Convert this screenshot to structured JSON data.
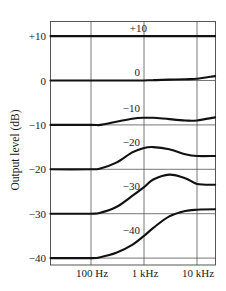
{
  "chart_data": {
    "type": "line",
    "title": "",
    "xlabel": "",
    "ylabel": "Output level (dB)",
    "x_scale": "log",
    "x_ticks": [
      {
        "value": 100,
        "label": "100 Hz"
      },
      {
        "value": 1000,
        "label": "1 kHz"
      },
      {
        "value": 10000,
        "label": "10 kHz"
      }
    ],
    "y_ticks": [
      {
        "value": 10,
        "label": "+10"
      },
      {
        "value": 0,
        "label": "0"
      },
      {
        "value": -10,
        "label": "−10"
      },
      {
        "value": -20,
        "label": "−20"
      },
      {
        "value": -30,
        "label": "−30"
      },
      {
        "value": -40,
        "label": "−40"
      }
    ],
    "xlim": [
      17,
      22000
    ],
    "ylim": [
      -41.5,
      13.5
    ],
    "grid": true,
    "legend": "none (curves labeled inline)",
    "x": [
      17,
      100,
      150,
      300,
      600,
      1000,
      1500,
      3000,
      6000,
      10000,
      22000
    ],
    "series": [
      {
        "name": "+10",
        "label": "+10",
        "values": [
          10,
          10,
          10,
          10,
          10,
          10,
          10,
          10,
          10,
          10,
          10
        ]
      },
      {
        "name": "0",
        "label": "0",
        "values": [
          0,
          0,
          0,
          0,
          0,
          0,
          0.1,
          0.2,
          0.3,
          0.4,
          1.0
        ]
      },
      {
        "name": "-10",
        "label": "−10",
        "values": [
          -10,
          -10,
          -10,
          -9.3,
          -8.6,
          -8.4,
          -8.4,
          -8.7,
          -9.0,
          -9.0,
          -8.3
        ]
      },
      {
        "name": "-20",
        "label": "−20",
        "values": [
          -20,
          -20,
          -19.8,
          -18.5,
          -16.2,
          -15.2,
          -15.0,
          -15.5,
          -16.6,
          -17.0,
          -17.0
        ]
      },
      {
        "name": "-30",
        "label": "−30",
        "values": [
          -30,
          -30,
          -29.8,
          -28.5,
          -26.0,
          -24.0,
          -22.3,
          -21.2,
          -22.0,
          -23.3,
          -23.5
        ]
      },
      {
        "name": "-40",
        "label": "−40",
        "values": [
          -40,
          -40,
          -39.8,
          -38.8,
          -37.0,
          -35.0,
          -33.2,
          -30.6,
          -29.4,
          -29.1,
          -29.0
        ]
      }
    ]
  }
}
